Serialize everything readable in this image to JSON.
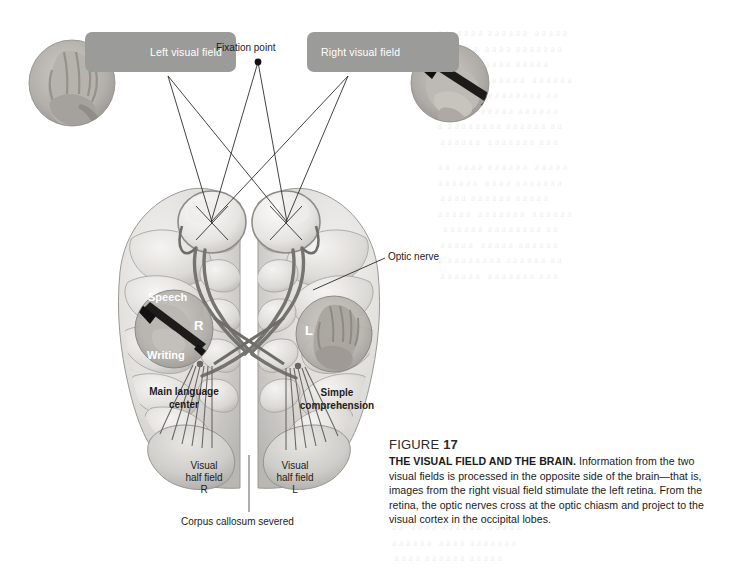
{
  "figure": {
    "domain_type": "textbook-anatomy-diagram",
    "background_color": "#ffffff",
    "banner_color": "#9b9b99",
    "overlay_circle_color": "#8a8a88",
    "line_color": "#2a2a2a",
    "nerve_color": "#6f6f6d"
  },
  "top_labels": {
    "left_visual_field": "Left visual field",
    "right_visual_field": "Right visual field",
    "fixation_point": "Fixation point"
  },
  "photos": {
    "left_circle_alt": "hand-photograph",
    "right_circle_alt": "hand-holding-pen-photograph"
  },
  "brain_labels": {
    "optic_nerve": "Optic nerve",
    "speech": "Speech",
    "writing": "Writing",
    "hemisphere_right_letter": "R",
    "hemisphere_left_letter": "L",
    "main_language_center_line1": "Main language",
    "main_language_center_line2": "center",
    "simple_comprehension_line1": "Simple",
    "simple_comprehension_line2": "comprehension",
    "visual_half_field_r_line1": "Visual",
    "visual_half_field_r_line2": "half field",
    "visual_half_field_r_line3": "R",
    "visual_half_field_l_line1": "Visual",
    "visual_half_field_l_line2": "half field",
    "visual_half_field_l_line3": "L",
    "corpus_callosum": "Corpus callosum severed"
  },
  "caption": {
    "figure_word": "FIGURE",
    "figure_number": "17",
    "title": "THE VISUAL FIELD AND THE BRAIN.",
    "body": " Information from the two visual fields is processed in the opposite side of the brain—that is, images from the right visual field stimulate the left retina. From the retina, the optic nerves cross at the optic chiasm and project to the visual cortex in the occipital lobes."
  },
  "bleed_text": {
    "right_block": "a a   a a a a  a a a a a a   a a a a a\na a a a a a   a a a a  a a a a a a a\n a a a a  a a a a a a  a a a a a\na a a a a   a a a a a a a   a a a a a a\n  a a a a a a  a a a a a a a a  a a\n a a a a a   a a a a a  a a a a a a\na  a a a a a a a a  a a a a a a  a a\n a a a a a a   a a a a a a a  a a a"
  }
}
